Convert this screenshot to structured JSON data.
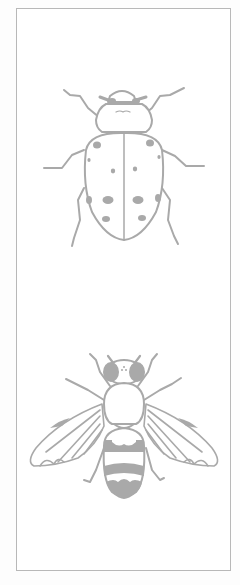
{
  "figure": {
    "type": "line-art illustration",
    "subjects": [
      {
        "id": "ladybird",
        "label": "Ladybird beetle",
        "position": "top",
        "spots": 12
      },
      {
        "id": "hoverfly",
        "label": "Hoverfly",
        "position": "bottom",
        "abdomen_bands": 3
      }
    ],
    "colors": {
      "background": "#ffffff",
      "frame": "#b8b8b8",
      "line": "#a9a9a9",
      "fill": "#a9a9a9"
    }
  }
}
